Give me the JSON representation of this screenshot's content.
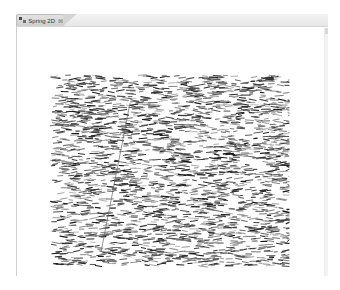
{
  "view": {
    "tab": {
      "label": "Spring 2D",
      "icon": "graph-layout-icon",
      "close_icon": "close-icon",
      "close_glyph": "⊠"
    }
  },
  "graph": {
    "layout": "spring-2d",
    "bounds": {
      "x0": 50,
      "y0": 75,
      "x1": 289,
      "y1": 266
    },
    "edge_count": 2600,
    "edge_length_min": 3,
    "edge_length_max": 9,
    "edge_colors": [
      "#1a1a1a",
      "#333333",
      "#555555",
      "#777777",
      "#999999"
    ],
    "background": "#ffffff",
    "long_edge": {
      "x1": 130,
      "y1": 103,
      "x2": 101,
      "y2": 252,
      "color": "#666666"
    },
    "seed": 20240
  },
  "footer": {
    "left_fragment": "",
    "right_fragment": ""
  }
}
